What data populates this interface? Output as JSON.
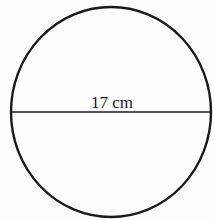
{
  "diagram": {
    "shape": "circle",
    "diameter_label": "17 cm",
    "stroke_color": "#1a1a1a",
    "background_color": "#fdfdfd"
  }
}
